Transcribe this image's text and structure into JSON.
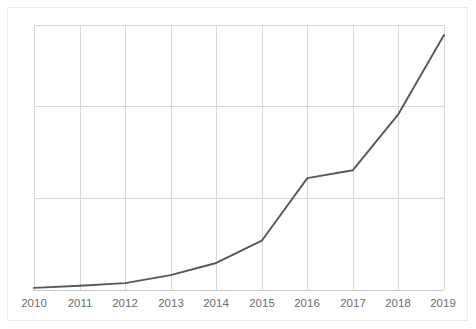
{
  "chart_data": {
    "type": "line",
    "title": "",
    "subtitle": "",
    "xlabel": "",
    "ylabel": "",
    "categories": [
      "2010",
      "2011",
      "2012",
      "2013",
      "2014",
      "2015",
      "2016",
      "2017",
      "2018",
      "2019"
    ],
    "x": [
      2010,
      2011,
      2012,
      2013,
      2014,
      2015,
      2016,
      2017,
      2018,
      2019
    ],
    "series": [
      {
        "name": "series-1",
        "color": "#585858",
        "values": [
          0.8,
          1.6,
          2.6,
          5.6,
          10.2,
          18.6,
          42.2,
          45.2,
          66.4,
          96.2
        ]
      }
    ],
    "xlim": [
      2010,
      2019
    ],
    "ylim": [
      0,
      100
    ],
    "xticks": [
      "2010",
      "2011",
      "2012",
      "2013",
      "2014",
      "2015",
      "2016",
      "2017",
      "2018",
      "2019"
    ],
    "yticks": [],
    "ytick_labels": [],
    "gridlines": {
      "vertical": [
        "2010",
        "2011",
        "2012",
        "2013",
        "2014",
        "2015",
        "2016",
        "2017",
        "2018",
        "2019"
      ],
      "horizontal_values": [
        0,
        35,
        70,
        100
      ],
      "visible": true,
      "color": "#d8d8d8"
    },
    "legend": {
      "visible": false,
      "position": "none",
      "entries": []
    },
    "annotations": [],
    "background_color": "#ffffff",
    "frame_color": "#ececec",
    "tick_label_color": "#6d6d6d"
  },
  "axis": {
    "x_tick_labels": [
      "2010",
      "2011",
      "2012",
      "2013",
      "2014",
      "2015",
      "2016",
      "2017",
      "2018",
      "2019"
    ]
  }
}
